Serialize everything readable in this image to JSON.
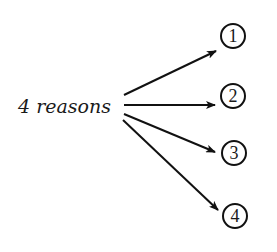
{
  "diagram": {
    "source_label": {
      "text": "4 reasons",
      "x": 18,
      "y": 113
    },
    "colors": {
      "stroke": "#111111",
      "text": "#1a1a1a",
      "background": "#ffffff"
    },
    "nodes": [
      {
        "label": "1",
        "cx": 233,
        "cy": 36,
        "r": 12
      },
      {
        "label": "2",
        "cx": 233,
        "cy": 96,
        "r": 12
      },
      {
        "label": "3",
        "cx": 234,
        "cy": 153,
        "r": 12
      },
      {
        "label": "4",
        "cx": 235,
        "cy": 216,
        "r": 12
      }
    ],
    "arrows": [
      {
        "from": "4 reasons",
        "to": "1",
        "x1": 124,
        "y1": 95,
        "x2": 216,
        "y2": 51
      },
      {
        "from": "4 reasons",
        "to": "2",
        "x1": 124,
        "y1": 105,
        "x2": 215,
        "y2": 105
      },
      {
        "from": "4 reasons",
        "to": "3",
        "x1": 124,
        "y1": 114,
        "x2": 215,
        "y2": 152
      },
      {
        "from": "4 reasons",
        "to": "4",
        "x1": 123,
        "y1": 120,
        "x2": 218,
        "y2": 210
      }
    ]
  }
}
